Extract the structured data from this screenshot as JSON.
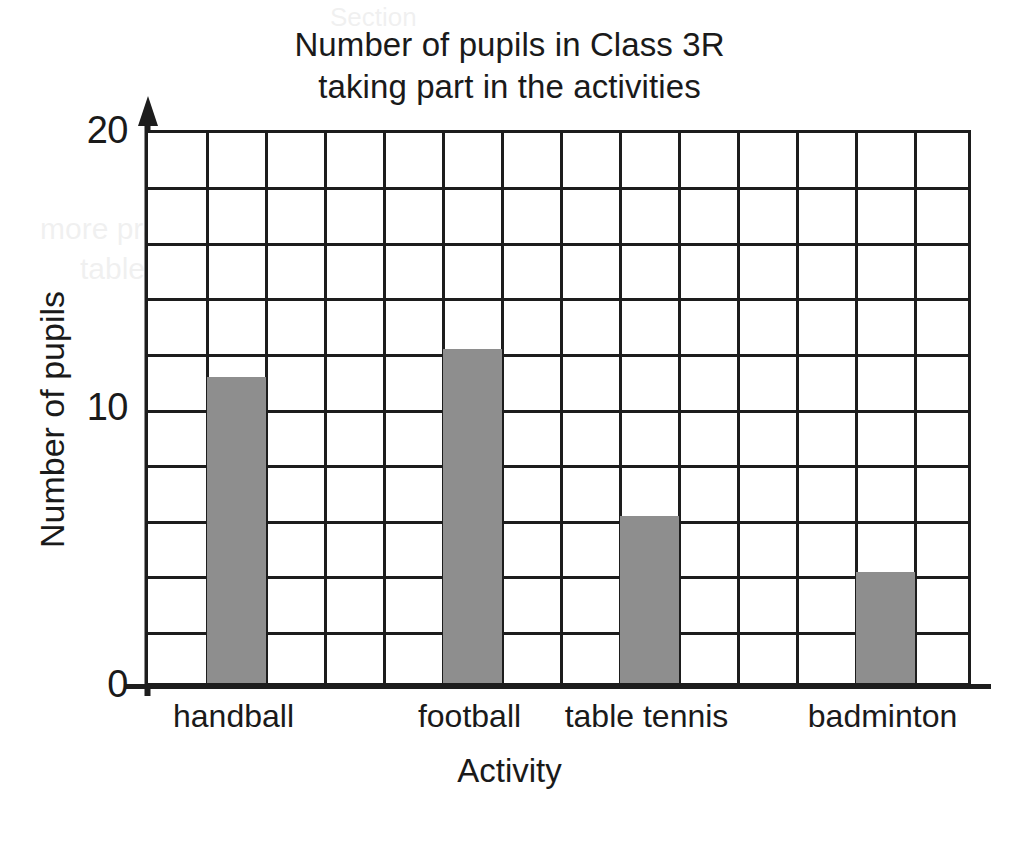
{
  "chart_data": {
    "type": "bar",
    "title": "Number of pupils in Class 3R taking part in the activities",
    "title_lines": [
      "Number of pupils in Class 3R",
      "taking part in the activities"
    ],
    "xlabel": "Activity",
    "ylabel": "Number of pupils",
    "categories": [
      "handball",
      "football",
      "table tennis",
      "badminton"
    ],
    "values": [
      11,
      12,
      6,
      4
    ],
    "ylim": [
      0,
      20
    ],
    "ytick_labels": [
      "0",
      "10",
      "20"
    ],
    "ytick_values": [
      0,
      10,
      20
    ],
    "gridline_step": 2,
    "grid": true,
    "legend": "none",
    "bar_color": "#8e8e8e",
    "axis_color": "#1d1d1d",
    "background_color": "#ffffff",
    "grid_columns": 14,
    "grid_rows": 10,
    "bar_column_index": [
      1,
      5,
      8,
      12
    ]
  },
  "ghost_text": {
    "line_top": "Section",
    "line_a": "more practice with the right way to find the best score",
    "line_b": "tables"
  }
}
